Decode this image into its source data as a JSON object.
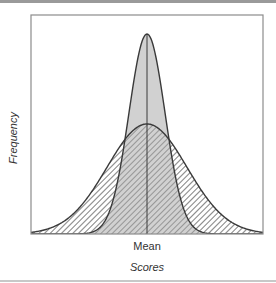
{
  "chart_data": {
    "type": "area",
    "title": "",
    "xlabel": "Scores",
    "ylabel": "Frequency",
    "x_tick_labels": [
      "Mean"
    ],
    "grid": false,
    "legend": null,
    "series": [
      {
        "name": "Narrow distribution (low variability)",
        "shape": "normal",
        "mean": 0,
        "relative_sd": 0.45,
        "relative_peak": 1.0,
        "fill": "gray"
      },
      {
        "name": "Wide distribution (high variability)",
        "shape": "normal",
        "mean": 0,
        "relative_sd": 1.0,
        "relative_peak": 0.55,
        "fill": "hatched"
      }
    ],
    "annotations": [
      "vertical line at mean"
    ]
  },
  "colors": {
    "frame": "#8c8c8c",
    "curve": "#3a3a3a",
    "gray_fill": "#c9c9c9",
    "hatch": "#555555"
  }
}
